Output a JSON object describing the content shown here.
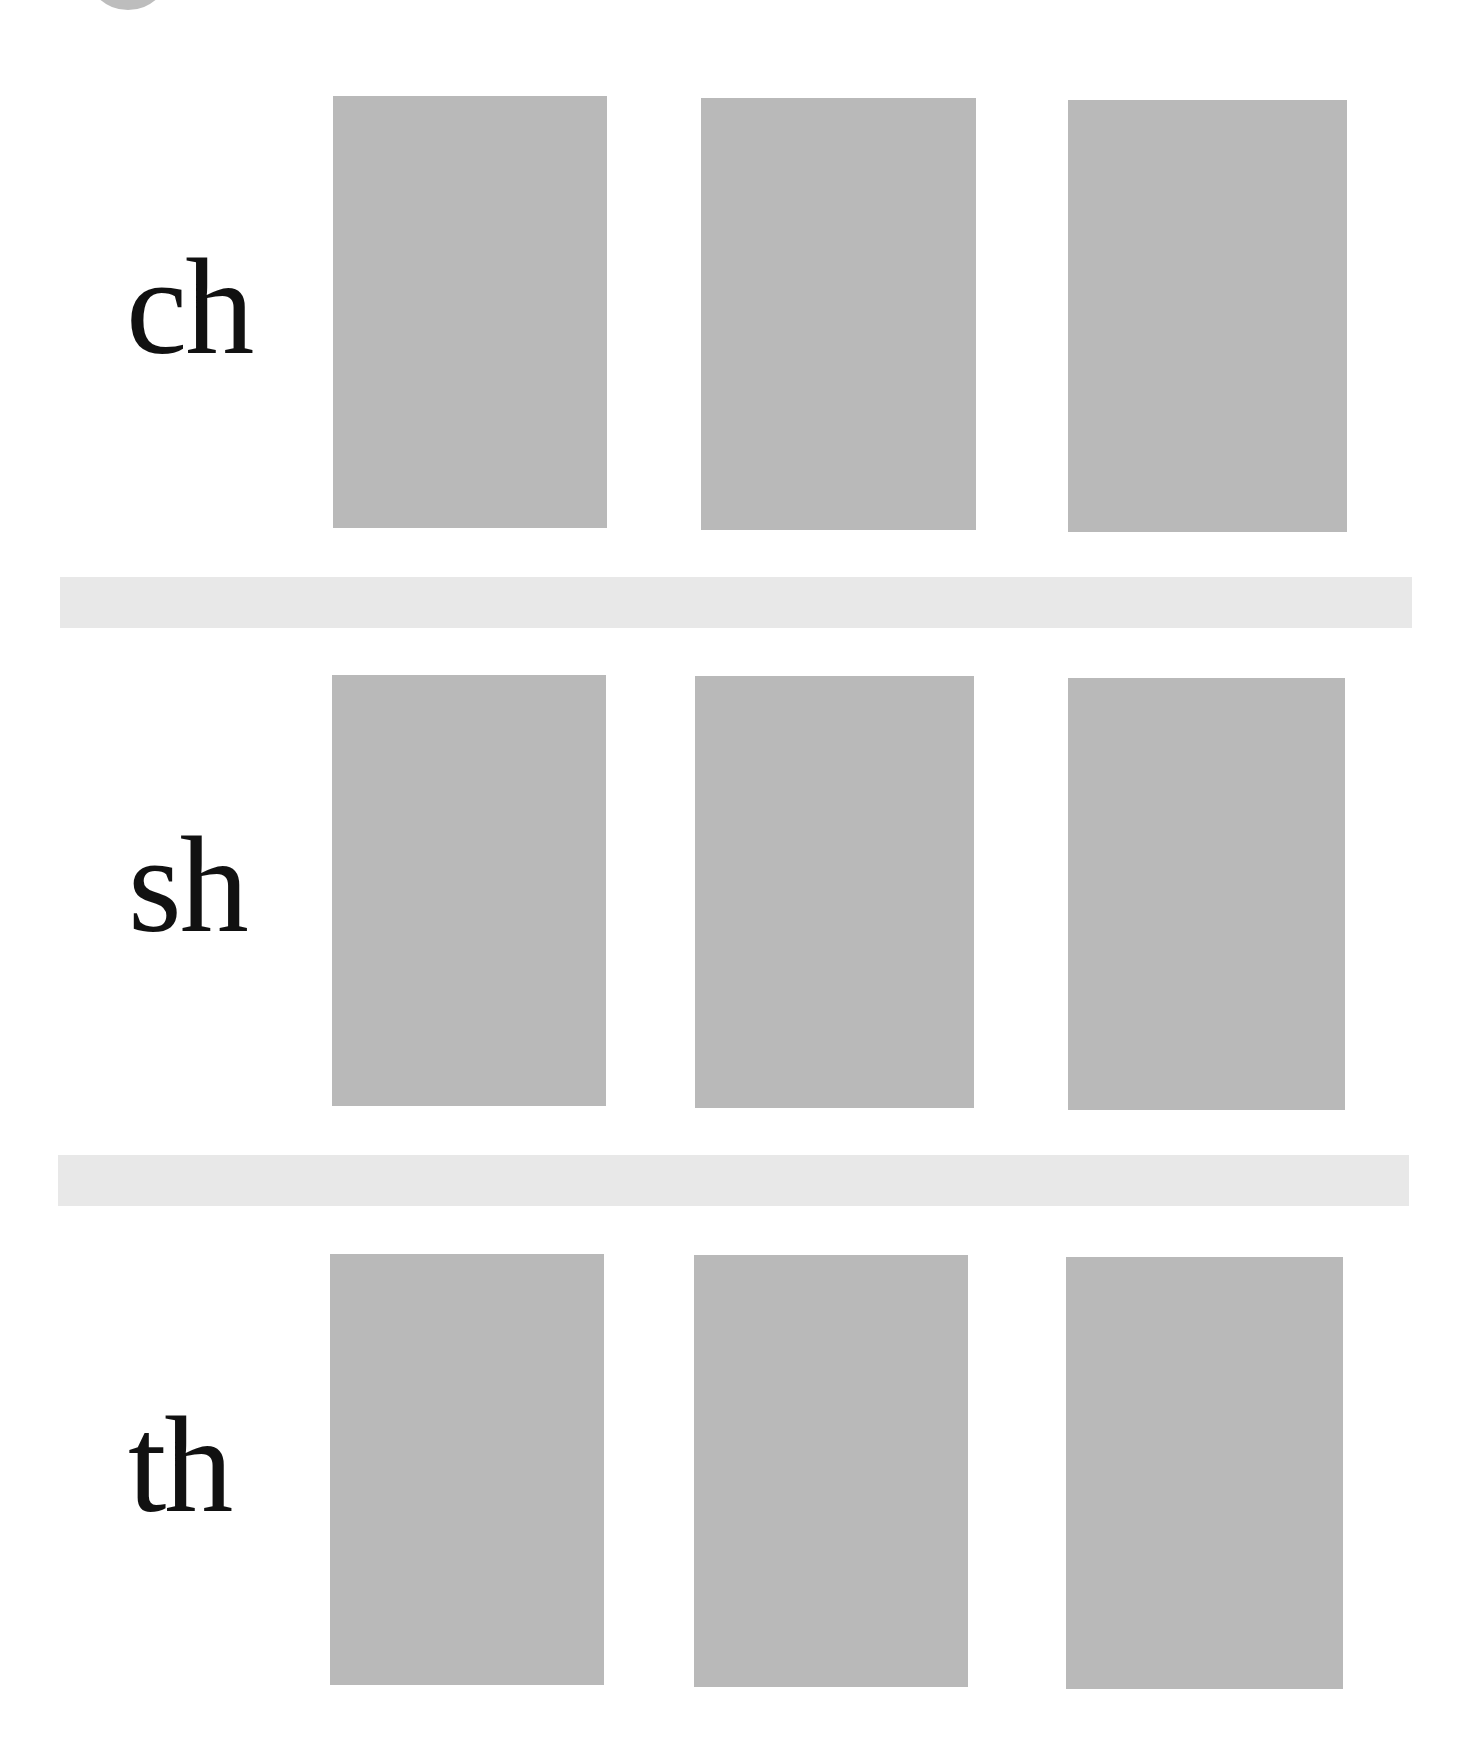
{
  "colors": {
    "card": "#b9b9b9",
    "separator": "#e8e8e8",
    "text": "#111111",
    "background": "#ffffff",
    "top_circle": "#bdbdbd"
  },
  "rows": [
    {
      "label": "ch",
      "cards": [
        {
          "position": 1,
          "content": ""
        },
        {
          "position": 2,
          "content": ""
        },
        {
          "position": 3,
          "content": ""
        }
      ]
    },
    {
      "label": "sh",
      "cards": [
        {
          "position": 1,
          "content": ""
        },
        {
          "position": 2,
          "content": ""
        },
        {
          "position": 3,
          "content": ""
        }
      ]
    },
    {
      "label": "th",
      "cards": [
        {
          "position": 1,
          "content": ""
        },
        {
          "position": 2,
          "content": ""
        },
        {
          "position": 3,
          "content": ""
        }
      ]
    }
  ]
}
